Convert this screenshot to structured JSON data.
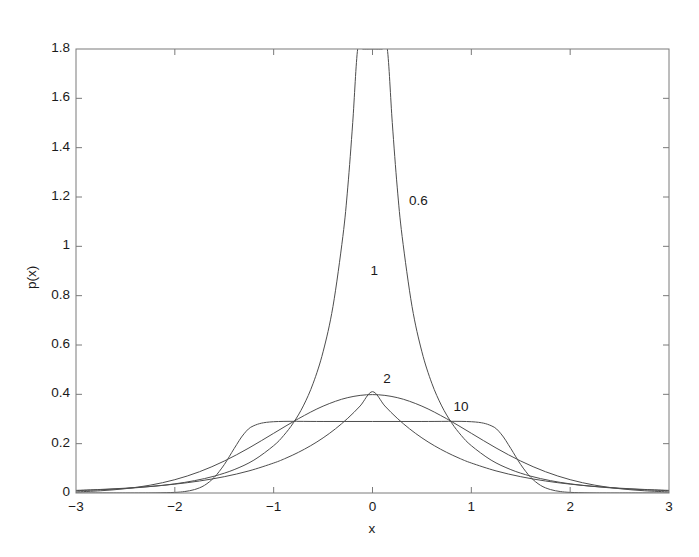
{
  "chart_data": {
    "type": "line",
    "title": "",
    "subtitle": "",
    "xlabel": "x",
    "ylabel": "p(x)",
    "xlim": [
      -3,
      3
    ],
    "ylim": [
      0,
      1.8
    ],
    "grid": false,
    "legend_position": "inline-annotations",
    "x_ticks": [
      "-3",
      "-2",
      "-1",
      "0",
      "1",
      "2",
      "3"
    ],
    "x_tick_values": [
      -3,
      -2,
      -1,
      0,
      1,
      2,
      3
    ],
    "y_ticks": [
      "0",
      "0.2",
      "0.4",
      "0.6",
      "0.8",
      "1",
      "1.2",
      "1.4",
      "1.6",
      "1.8"
    ],
    "y_tick_values": [
      0,
      0.2,
      0.4,
      0.6,
      0.8,
      1,
      1.2,
      1.4,
      1.6,
      1.8
    ],
    "line_color": "#4d4d4d",
    "axis_color": "#7a7a7a",
    "series": [
      {
        "name": "0.6",
        "shape_parameter": 0.6,
        "annotation": "0.6",
        "annotation_x": 0.37,
        "annotation_y": 1.18,
        "peak_value": 1.7,
        "x": [
          -3,
          -2.8,
          -2.6,
          -2.4,
          -2.2,
          -2,
          -1.8,
          -1.6,
          -1.4,
          -1.2,
          -1,
          -0.9,
          -0.8,
          -0.7,
          -0.6,
          -0.5,
          -0.4,
          -0.3,
          -0.25,
          -0.2,
          -0.15,
          -0.1,
          -0.06,
          -0.03,
          -0.012,
          0,
          0.012,
          0.03,
          0.06,
          0.1,
          0.15,
          0.2,
          0.25,
          0.3,
          0.4,
          0.5,
          0.6,
          0.7,
          0.8,
          0.9,
          1,
          1.2,
          1.4,
          1.6,
          1.8,
          2,
          2.2,
          2.4,
          2.6,
          2.8,
          3
        ],
        "y": [
          0.0095,
          0.0123,
          0.016,
          0.021,
          0.0278,
          0.0371,
          0.0501,
          0.0684,
          0.0947,
          0.1333,
          0.1919,
          0.2325,
          0.2847,
          0.3531,
          0.445,
          0.5724,
          0.7562,
          1.04,
          1.24,
          1.502,
          1.865,
          2.43,
          3.2,
          4.24,
          5.6,
          7.0,
          5.6,
          4.24,
          3.2,
          2.43,
          1.865,
          1.502,
          1.24,
          1.04,
          0.7562,
          0.5724,
          0.445,
          0.3531,
          0.2847,
          0.2325,
          0.1919,
          0.1333,
          0.0947,
          0.0684,
          0.0501,
          0.0371,
          0.0278,
          0.021,
          0.016,
          0.0123,
          0.0095
        ],
        "y_display_note": "rendered clipped at axis top 1.8"
      },
      {
        "name": "1",
        "shape_parameter": 1,
        "annotation": "1",
        "annotation_x": -0.02,
        "annotation_y": 0.895,
        "peak_value": 0.7,
        "x": [
          -3,
          -2.75,
          -2.5,
          -2.25,
          -2,
          -1.75,
          -1.5,
          -1.25,
          -1,
          -0.875,
          -0.75,
          -0.625,
          -0.5,
          -0.375,
          -0.25,
          -0.125,
          0,
          0.125,
          0.25,
          0.375,
          0.5,
          0.625,
          0.75,
          0.875,
          1,
          1.25,
          1.5,
          1.75,
          2,
          2.25,
          2.5,
          2.75,
          3
        ],
        "y": [
          0.0106,
          0.0144,
          0.0195,
          0.0265,
          0.0359,
          0.0487,
          0.0661,
          0.0896,
          0.1215,
          0.1415,
          0.1648,
          0.1919,
          0.2234,
          0.2602,
          0.303,
          0.3528,
          0.4108,
          0.3528,
          0.303,
          0.2602,
          0.2234,
          0.1919,
          0.1648,
          0.1415,
          0.1215,
          0.0896,
          0.0661,
          0.0487,
          0.0359,
          0.0265,
          0.0195,
          0.0144,
          0.0106
        ],
        "y_peak_actual": 0.7
      },
      {
        "name": "2",
        "shape_parameter": 2,
        "annotation": "2",
        "annotation_x": 0.11,
        "annotation_y": 0.46,
        "peak_value": 0.389,
        "x": [
          -3,
          -2.75,
          -2.5,
          -2.25,
          -2,
          -1.75,
          -1.5,
          -1.25,
          -1,
          -0.75,
          -0.5,
          -0.25,
          0,
          0.25,
          0.5,
          0.75,
          1,
          1.25,
          1.5,
          1.75,
          2,
          2.25,
          2.5,
          2.75,
          3
        ],
        "y": [
          0.0044,
          0.0091,
          0.0175,
          0.0317,
          0.054,
          0.0863,
          0.1295,
          0.1826,
          0.242,
          0.3011,
          0.3521,
          0.3867,
          0.3989,
          0.3867,
          0.3521,
          0.3011,
          0.242,
          0.1826,
          0.1295,
          0.0863,
          0.054,
          0.0317,
          0.0175,
          0.0091,
          0.0044
        ]
      },
      {
        "name": "10",
        "shape_parameter": 10,
        "annotation": "10",
        "annotation_x": 0.82,
        "annotation_y": 0.345,
        "plateau_value": 0.29,
        "x": [
          -3,
          -2.5,
          -2.2,
          -2,
          -1.9,
          -1.8,
          -1.7,
          -1.6,
          -1.5,
          -1.4,
          -1.3,
          -1.2,
          -1,
          -0.5,
          0,
          0.5,
          1,
          1.2,
          1.3,
          1.4,
          1.5,
          1.6,
          1.7,
          1.8,
          1.9,
          2,
          2.2,
          2.5,
          3
        ],
        "y": [
          0.0,
          0.0,
          0.0005,
          0.0025,
          0.006,
          0.014,
          0.031,
          0.064,
          0.115,
          0.18,
          0.24,
          0.273,
          0.289,
          0.29,
          0.29,
          0.29,
          0.289,
          0.273,
          0.24,
          0.18,
          0.115,
          0.064,
          0.031,
          0.014,
          0.006,
          0.0025,
          0.0005,
          0.0,
          0.0
        ]
      }
    ]
  },
  "axes": {
    "x_title": "x",
    "y_title": "p(x)"
  }
}
